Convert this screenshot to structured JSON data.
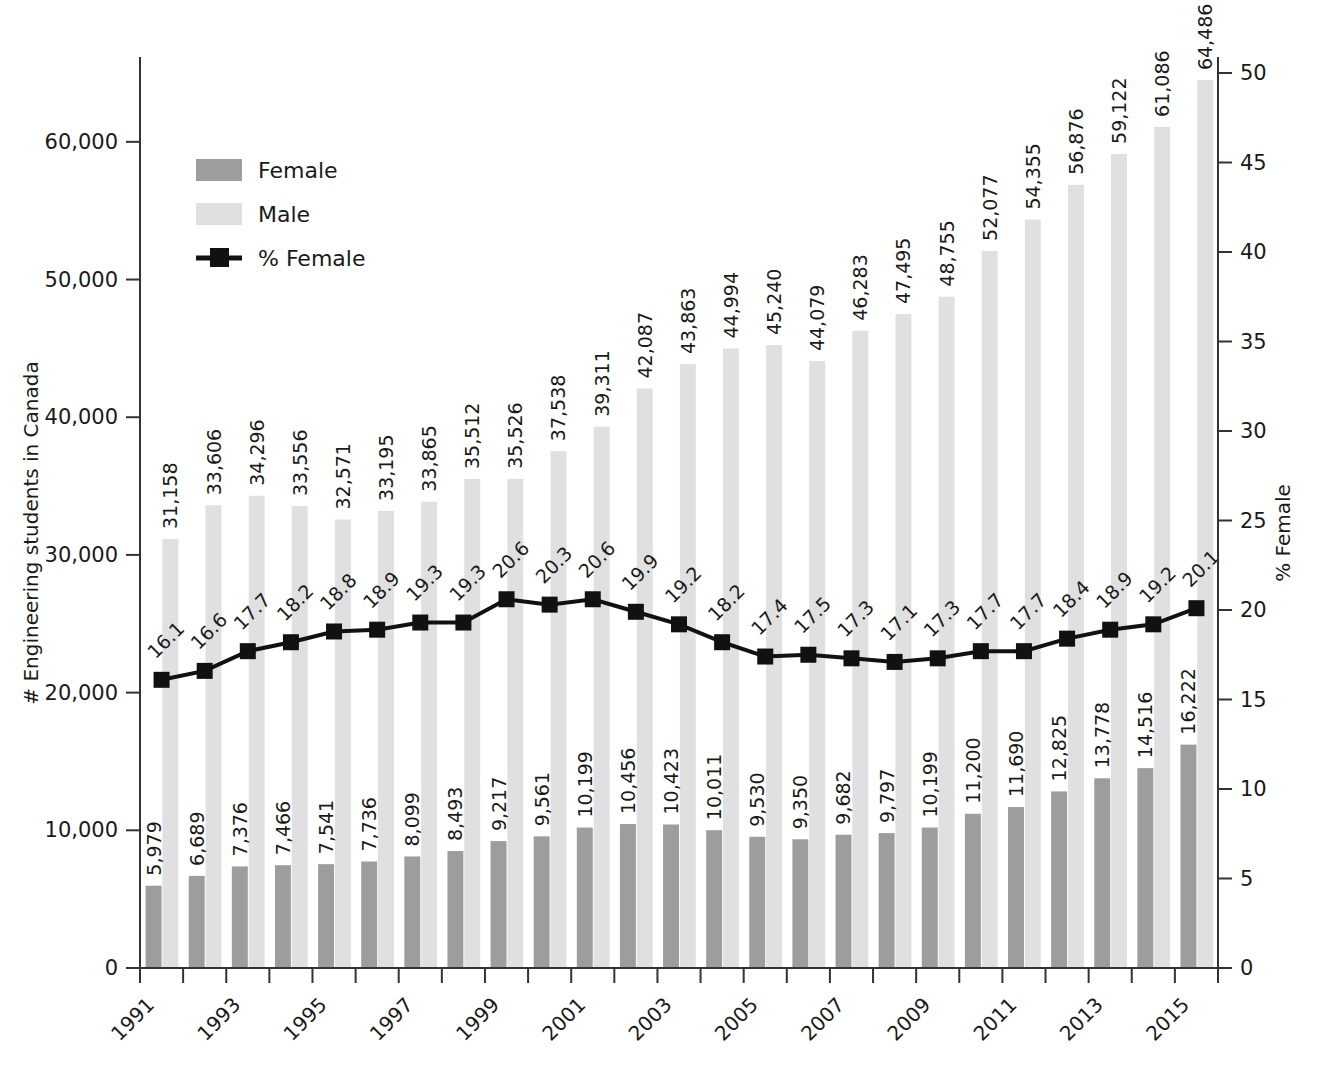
{
  "chart_data": {
    "type": "bar",
    "title": "",
    "xlabel": "",
    "ylabel": "# Engineering students in Canada",
    "y2label": "% Female",
    "ylim": [
      0,
      65000
    ],
    "y2lim": [
      0,
      50
    ],
    "yticks": [
      "0",
      "10,000",
      "20,000",
      "30,000",
      "40,000",
      "50,000",
      "60,000"
    ],
    "ytick_values": [
      0,
      10000,
      20000,
      30000,
      40000,
      50000,
      60000
    ],
    "y2ticks": [
      "0",
      "5",
      "10",
      "15",
      "20",
      "25",
      "30",
      "35",
      "40",
      "45",
      "50"
    ],
    "y2tick_values": [
      0,
      5,
      10,
      15,
      20,
      25,
      30,
      35,
      40,
      45,
      50
    ],
    "grid": false,
    "legend_position": "upper-left",
    "categories": [
      "1991",
      "1992",
      "1993",
      "1994",
      "1995",
      "1996",
      "1997",
      "1998",
      "1999",
      "2000",
      "2001",
      "2002",
      "2003",
      "2004",
      "2005",
      "2006",
      "2007",
      "2008",
      "2009",
      "2010",
      "2011",
      "2012",
      "2013",
      "2014",
      "2015"
    ],
    "xtick_labels": [
      "1991",
      "",
      "1993",
      "",
      "1995",
      "",
      "1997",
      "",
      "1999",
      "",
      "2001",
      "",
      "2003",
      "",
      "2005",
      "",
      "2007",
      "",
      "2009",
      "",
      "2011",
      "",
      "2013",
      "",
      "2015"
    ],
    "series": [
      {
        "name": "Female",
        "type": "bar",
        "axis": "left",
        "color": "#9d9d9d",
        "values": [
          5979,
          6689,
          7376,
          7466,
          7541,
          7736,
          8099,
          8493,
          9217,
          9561,
          10199,
          10456,
          10423,
          10011,
          9530,
          9350,
          9682,
          9797,
          10199,
          11200,
          11690,
          12825,
          13778,
          14516,
          16222
        ],
        "labels": [
          "5,979",
          "6,689",
          "7,376",
          "7,466",
          "7,541",
          "7,736",
          "8,099",
          "8,493",
          "9,217",
          "9,561",
          "10,199",
          "10,456",
          "10,423",
          "10,011",
          "9,530",
          "9,350",
          "9,682",
          "9,797",
          "10,199",
          "11,200",
          "11,690",
          "12,825",
          "13,778",
          "14,516",
          "16,222"
        ]
      },
      {
        "name": "Male",
        "type": "bar",
        "axis": "left",
        "color": "#e0e0e0",
        "values": [
          31158,
          33606,
          34296,
          33556,
          32571,
          33195,
          33865,
          35512,
          35526,
          37538,
          39311,
          42087,
          43863,
          44994,
          45240,
          44079,
          46283,
          47495,
          48755,
          52077,
          54355,
          56876,
          59122,
          61086,
          64486
        ],
        "labels": [
          "31,158",
          "33,606",
          "34,296",
          "33,556",
          "32,571",
          "33,195",
          "33,865",
          "35,512",
          "35,526",
          "37,538",
          "39,311",
          "42,087",
          "43,863",
          "44,994",
          "45,240",
          "44,079",
          "46,283",
          "47,495",
          "48,755",
          "52,077",
          "54,355",
          "56,876",
          "59,122",
          "61,086",
          "64,486"
        ]
      },
      {
        "name": "% Female",
        "type": "line",
        "axis": "right",
        "color": "#111111",
        "marker": "square",
        "values": [
          16.1,
          16.6,
          17.7,
          18.2,
          18.8,
          18.9,
          19.3,
          19.3,
          20.6,
          20.3,
          20.6,
          19.9,
          19.2,
          18.2,
          17.4,
          17.5,
          17.3,
          17.1,
          17.3,
          17.7,
          17.7,
          18.4,
          18.9,
          19.2,
          20.1
        ],
        "labels": [
          "16.1",
          "16.6",
          "17.7",
          "18.2",
          "18.8",
          "18.9",
          "19.3",
          "19.3",
          "20.6",
          "20.3",
          "20.6",
          "19.9",
          "19.2",
          "18.2",
          "17.4",
          "17.5",
          "17.3",
          "17.1",
          "17.3",
          "17.7",
          "17.7",
          "18.4",
          "18.9",
          "19.2",
          "20.1"
        ]
      }
    ],
    "legend": [
      {
        "label": "Female",
        "swatch": "#9d9d9d",
        "kind": "bar"
      },
      {
        "label": "Male",
        "swatch": "#e0e0e0",
        "kind": "bar"
      },
      {
        "label": "% Female",
        "swatch": "#111111",
        "kind": "line-marker"
      }
    ]
  }
}
